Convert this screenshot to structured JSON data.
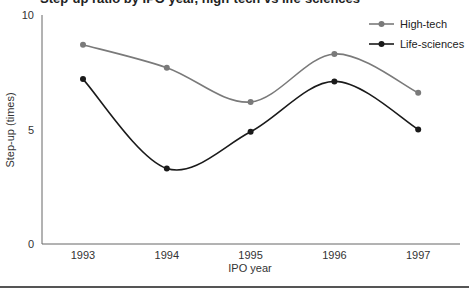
{
  "chart_data": {
    "type": "line",
    "title": "Step-up ratio by IPO year, high-tech vs life-sciences",
    "xlabel": "IPO year",
    "ylabel": "Step-up (times)",
    "categories": [
      "1993",
      "1994",
      "1995",
      "1996",
      "1997"
    ],
    "ylim": [
      0,
      10
    ],
    "yticks": [
      "0",
      "5",
      "10"
    ],
    "grid": false,
    "legend_position": "top-right",
    "smooth": true,
    "series": [
      {
        "name": "High-tech",
        "color": "#7a7a7a",
        "values": [
          8.7,
          7.7,
          6.2,
          8.3,
          6.6
        ]
      },
      {
        "name": "Life-sciences",
        "color": "#1a1a1a",
        "values": [
          7.2,
          3.3,
          4.9,
          7.1,
          5.0
        ]
      }
    ]
  }
}
